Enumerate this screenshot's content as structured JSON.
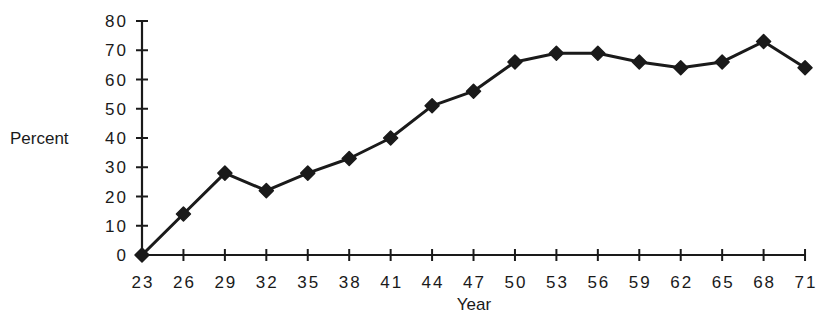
{
  "chart_data": {
    "type": "line",
    "title": "",
    "xlabel": "Year",
    "ylabel": "Percent",
    "x": [
      23,
      26,
      29,
      32,
      35,
      38,
      41,
      44,
      47,
      50,
      53,
      56,
      59,
      62,
      65,
      68,
      71
    ],
    "categories": [
      "23",
      "26",
      "29",
      "32",
      "35",
      "38",
      "41",
      "44",
      "47",
      "50",
      "53",
      "56",
      "59",
      "62",
      "65",
      "68",
      "71"
    ],
    "series": [
      {
        "name": "Percent",
        "values": [
          0,
          14,
          28,
          22,
          28,
          33,
          40,
          51,
          56,
          66,
          69,
          69,
          66,
          64,
          66,
          73,
          64
        ],
        "color": "#1a1a1a",
        "marker": "diamond"
      }
    ],
    "ylim": [
      0,
      80
    ],
    "yticks": [
      0,
      10,
      20,
      30,
      40,
      50,
      60,
      70,
      80
    ],
    "ytick_labels": [
      "0",
      "10",
      "20",
      "30",
      "40",
      "50",
      "60",
      "70",
      "80"
    ],
    "grid": false,
    "legend": null
  },
  "colors": {
    "ink": "#1a1a1a",
    "background": "#ffffff"
  }
}
